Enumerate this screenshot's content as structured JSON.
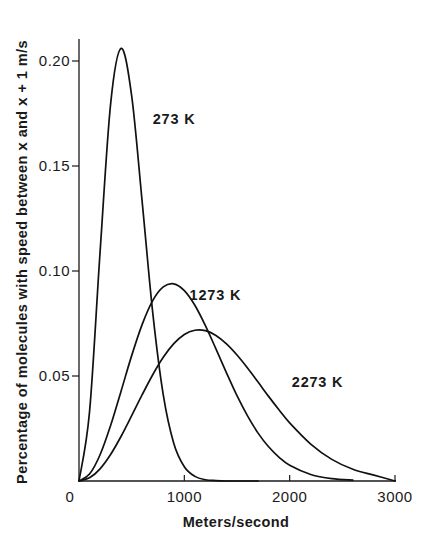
{
  "chart_data": {
    "type": "line",
    "title": "",
    "xlabel": "Meters/second",
    "ylabel": {
      "parts": [
        "Percentage of molecules with speed between ",
        "x",
        " and ",
        "x",
        " + 1 m/s"
      ],
      "full": "Percentage of molecules with speed between x and x + 1 m/s"
    },
    "xlim": [
      0,
      3000
    ],
    "ylim": [
      0,
      0.21
    ],
    "grid": false,
    "legend": "inline labels",
    "x_ticks": [
      {
        "value": 0,
        "label": "0"
      },
      {
        "value": 1000,
        "label": "1000"
      },
      {
        "value": 2000,
        "label": "2000"
      },
      {
        "value": 3000,
        "label": "3000"
      }
    ],
    "y_ticks": [
      {
        "value": 0.05,
        "label": "0.05"
      },
      {
        "value": 0.1,
        "label": "0.10"
      },
      {
        "value": 0.15,
        "label": "0.15"
      },
      {
        "value": 0.2,
        "label": "0.20"
      }
    ],
    "series": [
      {
        "name": "273 K",
        "label_pos": [
          700,
          0.17
        ],
        "peak": [
          400,
          0.206
        ],
        "x": [
          0,
          100,
          200,
          300,
          400,
          500,
          600,
          700,
          800,
          900,
          1000,
          1100,
          1200,
          1300,
          1400,
          1500,
          1600,
          1700
        ],
        "values": [
          0,
          0.0329,
          0.109,
          0.1795,
          0.206,
          0.1834,
          0.1328,
          0.0802,
          0.041,
          0.0179,
          0.0068,
          0.0022,
          0.0006,
          0.0002,
          0.0,
          0.0,
          0.0,
          0.0
        ]
      },
      {
        "name": "1273 K",
        "label_pos": [
          1050,
          0.086
        ],
        "peak": [
          880,
          0.094
        ],
        "x": [
          0,
          100,
          200,
          300,
          400,
          500,
          600,
          700,
          800,
          900,
          1000,
          1100,
          1200,
          1300,
          1400,
          1500,
          1600,
          1700,
          1800,
          1900,
          2000,
          2200,
          2400,
          2600
        ],
        "values": [
          0,
          0.0033,
          0.0125,
          0.0264,
          0.0429,
          0.0597,
          0.0746,
          0.0859,
          0.0924,
          0.0939,
          0.0907,
          0.0837,
          0.074,
          0.0629,
          0.0515,
          0.0406,
          0.031,
          0.0228,
          0.0163,
          0.0113,
          0.0075,
          0.0031,
          0.0011,
          0.0004
        ]
      },
      {
        "name": "2273 K",
        "label_pos": [
          2020,
          0.045
        ],
        "peak": [
          1140,
          0.072
        ],
        "x": [
          0,
          100,
          200,
          300,
          400,
          500,
          600,
          700,
          800,
          900,
          1000,
          1100,
          1200,
          1300,
          1400,
          1500,
          1600,
          1700,
          1800,
          1900,
          2000,
          2200,
          2400,
          2600,
          2800,
          3000
        ],
        "values": [
          0,
          0.0015,
          0.0058,
          0.0126,
          0.0213,
          0.0311,
          0.0411,
          0.0506,
          0.0589,
          0.0654,
          0.0698,
          0.0718,
          0.0716,
          0.0693,
          0.0653,
          0.06,
          0.0538,
          0.0471,
          0.0403,
          0.0338,
          0.0277,
          0.0176,
          0.0103,
          0.0056,
          0.0028,
          0.0
        ]
      }
    ]
  }
}
